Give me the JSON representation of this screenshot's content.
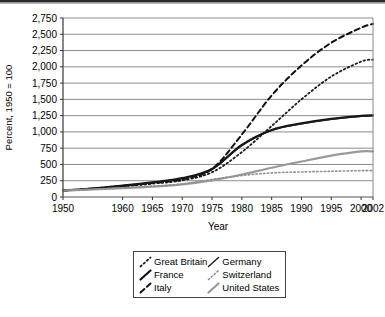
{
  "figure": {
    "y_axis_title": "Percent, 1950 = 100",
    "x_axis_title": "Year",
    "y_ticks": [
      "2,750",
      "2,500",
      "2,250",
      "2,000",
      "1,750",
      "1,500",
      "1,250",
      "1,000",
      "750",
      "500",
      "250",
      "0"
    ],
    "x_ticks": [
      "1950",
      "1960",
      "1965",
      "1970",
      "1975",
      "1980",
      "1985",
      "1990",
      "1995",
      "2000",
      "2002"
    ]
  },
  "legend": {
    "items": [
      {
        "label": "Great Britain",
        "style": "dotted",
        "color": "#1a1a1a",
        "width": 1.8
      },
      {
        "label": "Germany",
        "style": "solid",
        "color": "#1a1a1a",
        "width": 1.4
      },
      {
        "label": "France",
        "style": "solid",
        "color": "#111111",
        "width": 2.2
      },
      {
        "label": "Switzerland",
        "style": "dotted",
        "color": "#8f8f8f",
        "width": 1.6
      },
      {
        "label": "Italy",
        "style": "dashed",
        "color": "#111111",
        "width": 2.0
      },
      {
        "label": "United States",
        "style": "solid",
        "color": "#9a9a9a",
        "width": 2.2
      }
    ]
  },
  "chart_data": {
    "type": "line",
    "title": "",
    "xlabel": "Year",
    "ylabel": "Percent, 1950 = 100",
    "xlim": [
      1950,
      2002
    ],
    "ylim": [
      0,
      2750
    ],
    "ytick_values": [
      0,
      250,
      500,
      750,
      1000,
      1250,
      1500,
      1750,
      2000,
      2250,
      2500,
      2750
    ],
    "xtick_values": [
      1950,
      1960,
      1965,
      1970,
      1975,
      1980,
      1985,
      1990,
      1995,
      2000,
      2002
    ],
    "grid": "horizontal",
    "legend_position": "below-center",
    "x": [
      1950,
      1955,
      1960,
      1965,
      1970,
      1975,
      1980,
      1985,
      1990,
      1995,
      2000,
      2002
    ],
    "series": [
      {
        "name": "Italy",
        "style": "dashed",
        "color": "#111111",
        "values": [
          100,
          130,
          170,
          215,
          270,
          430,
          960,
          1560,
          2020,
          2370,
          2600,
          2660
        ]
      },
      {
        "name": "Great Britain",
        "style": "dotted",
        "color": "#1a1a1a",
        "values": [
          100,
          125,
          160,
          205,
          255,
          380,
          690,
          1090,
          1500,
          1850,
          2080,
          2110
        ]
      },
      {
        "name": "France",
        "style": "solid",
        "color": "#111111",
        "values": [
          100,
          130,
          175,
          225,
          290,
          430,
          800,
          1030,
          1130,
          1200,
          1245,
          1255
        ]
      },
      {
        "name": "Germany",
        "style": "solid",
        "color": "#1a1a1a",
        "values": [
          100,
          128,
          170,
          220,
          285,
          425,
          790,
          1025,
          1125,
          1195,
          1240,
          1250
        ]
      },
      {
        "name": "United States",
        "style": "solid",
        "color": "#9a9a9a",
        "values": [
          100,
          115,
          135,
          160,
          195,
          255,
          345,
          450,
          545,
          635,
          700,
          700
        ]
      },
      {
        "name": "Switzerland",
        "style": "dotted",
        "color": "#8f8f8f",
        "values": [
          100,
          118,
          140,
          165,
          200,
          270,
          330,
          370,
          385,
          395,
          405,
          405
        ]
      }
    ]
  }
}
